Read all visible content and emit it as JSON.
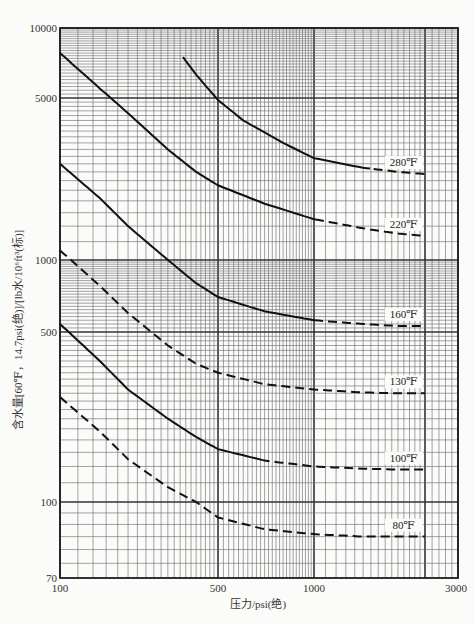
{
  "chart_data": {
    "type": "line",
    "title": "",
    "xlabel": "压力/psi(绝)",
    "ylabel": "含水量[60℉，14.7psi(绝)]/[lb水/10⁶ft³(标)]",
    "xscale": "log",
    "yscale": "log",
    "xlim": [
      100,
      3000
    ],
    "ylim": [
      70,
      10000
    ],
    "grid": true,
    "legend": "inline labels at right end of curves",
    "x_tick_labels": [
      "100",
      "500",
      "1000",
      "3000"
    ],
    "y_tick_labels": [
      "10000",
      "5000",
      "1000",
      "500",
      "100",
      "70"
    ],
    "series": [
      {
        "name": "280℉",
        "label": "280℉",
        "points": [
          [
            350,
            7500
          ],
          [
            400,
            6300
          ],
          [
            500,
            4900
          ],
          [
            600,
            4000
          ],
          [
            800,
            3200
          ],
          [
            1000,
            2750
          ],
          [
            1500,
            2500
          ],
          [
            2000,
            2400
          ],
          [
            2500,
            2350
          ]
        ],
        "dashed_from": 1600
      },
      {
        "name": "220℉",
        "label": "220℉",
        "points": [
          [
            100,
            7800
          ],
          [
            150,
            5500
          ],
          [
            200,
            4300
          ],
          [
            300,
            3000
          ],
          [
            400,
            2400
          ],
          [
            500,
            2100
          ],
          [
            700,
            1750
          ],
          [
            1000,
            1500
          ],
          [
            1500,
            1370
          ],
          [
            2000,
            1300
          ],
          [
            2500,
            1270
          ]
        ],
        "dashed_from": 1100
      },
      {
        "name": "160℉",
        "label": "160℉",
        "points": [
          [
            100,
            2600
          ],
          [
            150,
            1850
          ],
          [
            200,
            1400
          ],
          [
            300,
            1000
          ],
          [
            400,
            800
          ],
          [
            500,
            700
          ],
          [
            700,
            610
          ],
          [
            1000,
            560
          ],
          [
            1500,
            540
          ],
          [
            2000,
            530
          ],
          [
            2500,
            530
          ]
        ],
        "dashed_from": 1000
      },
      {
        "name": "130℉",
        "label": "130℉",
        "points": [
          [
            100,
            1100
          ],
          [
            150,
            780
          ],
          [
            200,
            600
          ],
          [
            300,
            440
          ],
          [
            400,
            370
          ],
          [
            500,
            340
          ],
          [
            700,
            305
          ],
          [
            1000,
            290
          ],
          [
            1500,
            282
          ],
          [
            2000,
            280
          ],
          [
            2500,
            280
          ]
        ],
        "dashed_from": 100
      },
      {
        "name": "100℉",
        "label": "100℉",
        "points": [
          [
            100,
            540
          ],
          [
            150,
            380
          ],
          [
            200,
            290
          ],
          [
            300,
            220
          ],
          [
            400,
            185
          ],
          [
            500,
            165
          ],
          [
            700,
            148
          ],
          [
            1000,
            140
          ],
          [
            1500,
            137
          ],
          [
            2000,
            136
          ],
          [
            2500,
            136
          ]
        ],
        "dashed_from": 750
      },
      {
        "name": "80℉",
        "label": "80℉",
        "points": [
          [
            100,
            270
          ],
          [
            150,
            195
          ],
          [
            200,
            150
          ],
          [
            300,
            115
          ],
          [
            400,
            100
          ],
          [
            500,
            93
          ],
          [
            700,
            88
          ],
          [
            1000,
            86
          ],
          [
            1500,
            85
          ],
          [
            2000,
            85
          ],
          [
            2500,
            85
          ]
        ],
        "dashed_from": 100
      }
    ]
  },
  "axes": {
    "xlabel": "压力/psi(绝)",
    "ylabel": "含水量[60℉，14.7psi(绝)]/[lb水/10⁶ft³(标)]"
  }
}
